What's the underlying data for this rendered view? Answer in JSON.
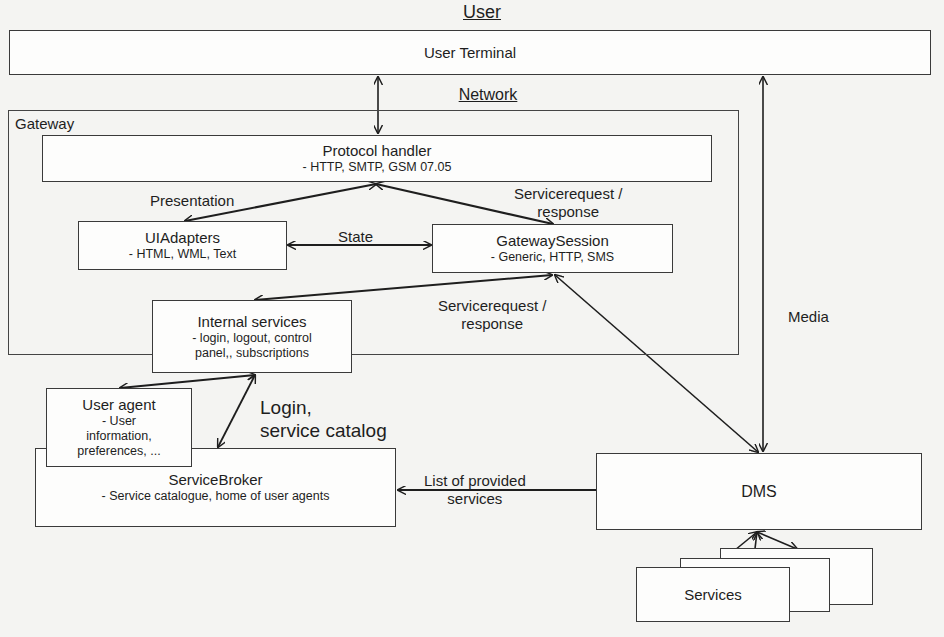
{
  "diagram": {
    "headings": {
      "user": "User",
      "network": "Network"
    },
    "boxes": {
      "user_terminal": {
        "title": "User Terminal"
      },
      "gateway": {
        "title": "Gateway"
      },
      "protocol_handler": {
        "title": "Protocol handler",
        "subtitle": "- HTTP, SMTP, GSM 07.05"
      },
      "ui_adapters": {
        "title": "UIAdapters",
        "subtitle": "- HTML, WML, Text"
      },
      "gateway_session": {
        "title": "GatewaySession",
        "subtitle": "- Generic, HTTP, SMS"
      },
      "internal_services": {
        "title": "Internal services",
        "subtitle_line1": "- login, logout, control",
        "subtitle_line2": "panel,, subscriptions"
      },
      "user_agent": {
        "title": "User agent",
        "subtitle_line1": "- User",
        "subtitle_line2": "information,",
        "subtitle_line3": "preferences, ..."
      },
      "service_broker": {
        "title": "ServiceBroker",
        "subtitle": "- Service catalogue, home of user agents"
      },
      "dms": {
        "title": "DMS"
      },
      "services": {
        "title": "Services"
      }
    },
    "edge_labels": {
      "presentation": "Presentation",
      "state": "State",
      "servicerequest_top_line1": "Servicerequest /",
      "servicerequest_top_line2": "response",
      "servicerequest_mid_line1": "Servicerequest /",
      "servicerequest_mid_line2": "response",
      "media": "Media",
      "login_line1": "Login,",
      "login_line2": "service catalog",
      "list_line1": "List of provided",
      "list_line2": "services"
    },
    "edges": [
      {
        "from": "user_terminal",
        "to": "protocol_handler",
        "bidirectional": true
      },
      {
        "from": "protocol_handler",
        "to": "ui_adapters",
        "label": "presentation",
        "bidirectional": true
      },
      {
        "from": "protocol_handler",
        "to": "gateway_session",
        "label": "servicerequest_top",
        "bidirectional": true
      },
      {
        "from": "ui_adapters",
        "to": "gateway_session",
        "label": "state",
        "bidirectional": true
      },
      {
        "from": "gateway_session",
        "to": "internal_services",
        "label": "servicerequest_mid",
        "bidirectional": true
      },
      {
        "from": "gateway_session",
        "to": "dms",
        "bidirectional": true
      },
      {
        "from": "user_terminal",
        "to": "dms",
        "label": "media",
        "bidirectional": true
      },
      {
        "from": "internal_services",
        "to": "user_agent",
        "bidirectional": true
      },
      {
        "from": "internal_services",
        "to": "service_broker",
        "label": "login",
        "bidirectional": true
      },
      {
        "from": "dms",
        "to": "service_broker",
        "label": "list"
      },
      {
        "from": "dms",
        "to": "services",
        "bidirectional": true,
        "count": 3
      }
    ],
    "colors": {
      "line": "#1e1e1e",
      "box_border": "#3a3a3a",
      "paper": "#f4f4f2"
    }
  }
}
